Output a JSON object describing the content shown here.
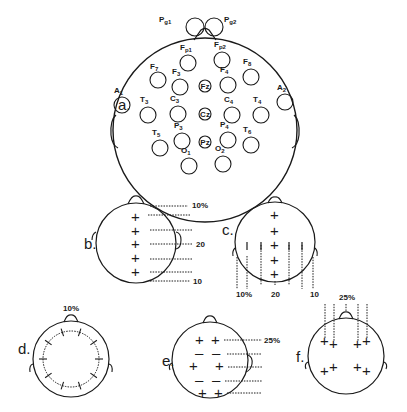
{
  "figure": {
    "panels": [
      {
        "id": "a",
        "label": "a."
      },
      {
        "id": "b",
        "label": "b.",
        "percent_labels": [
          "10%",
          "20",
          "10"
        ]
      },
      {
        "id": "c",
        "label": "c.",
        "percent_labels": [
          "10%",
          "20",
          "10"
        ]
      },
      {
        "id": "d",
        "label": "d.",
        "percent_labels": [
          "10%"
        ]
      },
      {
        "id": "e",
        "label": "e.",
        "percent_labels": [
          "25%"
        ]
      },
      {
        "id": "f",
        "label": "f.",
        "percent_labels": [
          "25%"
        ]
      }
    ],
    "electrodes": [
      {
        "name": "Pg1",
        "main": "P",
        "sub": "g1"
      },
      {
        "name": "Pg2",
        "main": "P",
        "sub": "g2"
      },
      {
        "name": "Fp1",
        "main": "F",
        "sub": "p1"
      },
      {
        "name": "Fp2",
        "main": "F",
        "sub": "p2"
      },
      {
        "name": "F7",
        "main": "F",
        "sub": "7"
      },
      {
        "name": "F3",
        "main": "F",
        "sub": "3"
      },
      {
        "name": "Fz",
        "main": "Fz",
        "sub": ""
      },
      {
        "name": "F4",
        "main": "F",
        "sub": "4"
      },
      {
        "name": "F8",
        "main": "F",
        "sub": "8"
      },
      {
        "name": "A1",
        "main": "A",
        "sub": "1"
      },
      {
        "name": "T3",
        "main": "T",
        "sub": "3"
      },
      {
        "name": "C3",
        "main": "C",
        "sub": "3"
      },
      {
        "name": "Cz",
        "main": "Cz",
        "sub": ""
      },
      {
        "name": "C4",
        "main": "C",
        "sub": "4"
      },
      {
        "name": "T4",
        "main": "T",
        "sub": "4"
      },
      {
        "name": "A2",
        "main": "A",
        "sub": "2"
      },
      {
        "name": "T5",
        "main": "T",
        "sub": "5"
      },
      {
        "name": "P3",
        "main": "P",
        "sub": "3"
      },
      {
        "name": "Pz",
        "main": "Pz",
        "sub": ""
      },
      {
        "name": "P4",
        "main": "P",
        "sub": "4"
      },
      {
        "name": "T6",
        "main": "T",
        "sub": "6"
      },
      {
        "name": "O1",
        "main": "O",
        "sub": "1"
      },
      {
        "name": "O2",
        "main": "O",
        "sub": "2"
      }
    ]
  }
}
